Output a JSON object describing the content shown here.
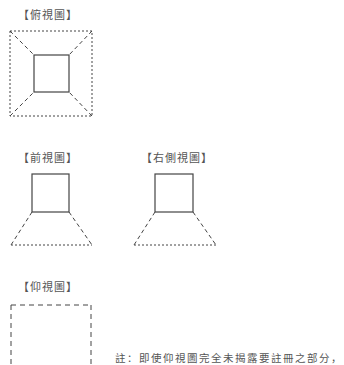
{
  "views": {
    "top": "【俯視圖】",
    "front": "【前視圖】",
    "right_side": "【右側視圖】",
    "bottom": "【仰視圖】"
  },
  "note": {
    "line1": "註：即使仰視圖完全未揭露要註冊之部分，",
    "line2": "本仰視圖予以省略。"
  },
  "colors": {
    "line": "#444444",
    "text": "#555555"
  }
}
